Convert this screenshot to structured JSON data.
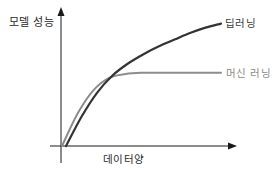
{
  "chart_data": {
    "type": "line",
    "title": "",
    "xlabel": "데이터양",
    "ylabel": "모델 성능",
    "grid": false,
    "legend_position": "inline-right",
    "x_ticks": [],
    "y_ticks": [],
    "xlim": [
      0,
      100
    ],
    "ylim": [
      0,
      100
    ],
    "x": [
      0,
      10,
      20,
      30,
      40,
      50,
      60,
      70,
      80,
      90,
      100
    ],
    "series": [
      {
        "name": "딥러닝",
        "color": "#333333",
        "values": [
          0,
          22,
          40,
          53,
          62,
          69,
          75,
          80,
          85,
          89,
          92
        ]
      },
      {
        "name": "머신 러닝",
        "color": "#8c8c8c",
        "values": [
          0,
          27,
          46,
          56,
          59,
          60,
          60,
          60,
          60,
          60,
          60
        ]
      }
    ],
    "annotations": [
      {
        "text": "딥러닝",
        "attached_to": "딥러닝 line end"
      },
      {
        "text": "머신 러닝",
        "attached_to": "머신 러닝 line end"
      }
    ]
  },
  "labels": {
    "y_axis": "모델 성능",
    "x_axis": "데이터양",
    "series_deep": "딥러닝",
    "series_ml": "머신 러닝"
  },
  "colors": {
    "axis": "#1a1a1a",
    "deep_learning": "#333333",
    "machine_learning": "#8c8c8c"
  }
}
